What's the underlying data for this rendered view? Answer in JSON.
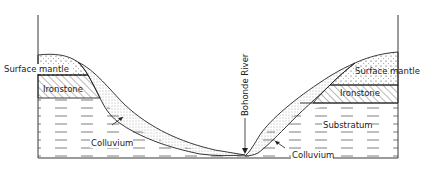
{
  "diagram": {
    "type": "geological cross-section",
    "labels": {
      "surface_mantle_left": "Surface mantle",
      "ironstone_left": "Ironstone",
      "colluvium_left": "Colluvium",
      "river": "Bohonde River",
      "surface_mantle_right": "Surface mantle",
      "ironstone_right": "Ironstone",
      "substratum": "Substratum",
      "colluvium_right": "Colluvium"
    },
    "layers": [
      "Surface mantle",
      "Ironstone",
      "Substratum",
      "Colluvium"
    ],
    "colors": {
      "line": "#222222",
      "background": "#ffffff"
    }
  }
}
